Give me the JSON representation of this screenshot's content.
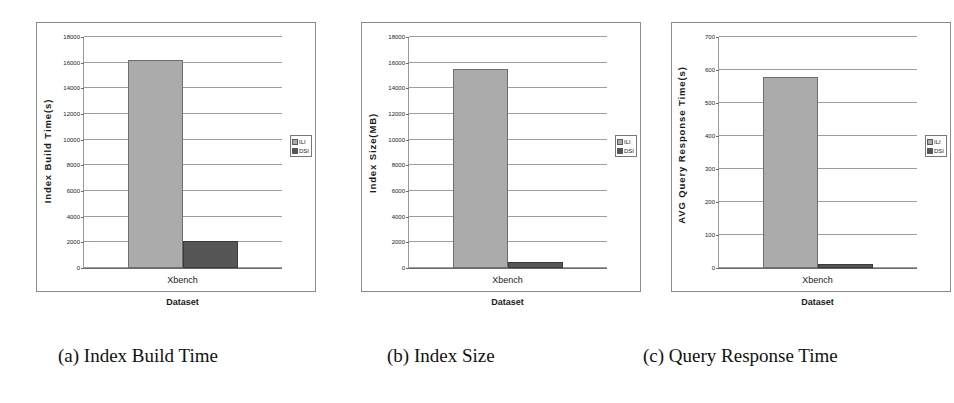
{
  "figure": {
    "background": "#ffffff",
    "series_colors": {
      "ILI": "#ababab",
      "DSI": "#565656"
    },
    "captions": [
      {
        "id": "a",
        "text": "(a) Index Build Time"
      },
      {
        "id": "b",
        "text": "(b) Index Size"
      },
      {
        "id": "c",
        "text": "(c) Query Response Time"
      }
    ]
  },
  "chart_data": [
    {
      "type": "bar",
      "title": "(a) Index Build Time",
      "xlabel": "Dataset",
      "ylabel": "Index  Build  Time(s)",
      "categories": [
        "Xbench"
      ],
      "series": [
        {
          "name": "ILI",
          "values": [
            16200
          ]
        },
        {
          "name": "DSI",
          "values": [
            2100
          ]
        }
      ],
      "ylim": [
        0,
        18000
      ],
      "yticks": [
        0,
        2000,
        4000,
        6000,
        8000,
        10000,
        12000,
        14000,
        16000,
        18000
      ],
      "ytick_labels": [
        "0",
        "2000",
        "4000",
        "6000",
        "8000",
        "10000",
        "12000",
        "14000",
        "16000",
        "18000"
      ],
      "grid": true,
      "legend": [
        "ILI",
        "DSI"
      ],
      "legend_position": "right"
    },
    {
      "type": "bar",
      "title": "(b) Index Size",
      "xlabel": "Dataset",
      "ylabel": "Index  Size(MB)",
      "categories": [
        "Xbench"
      ],
      "series": [
        {
          "name": "ILI",
          "values": [
            15500
          ]
        },
        {
          "name": "DSI",
          "values": [
            450
          ]
        }
      ],
      "ylim": [
        0,
        18000
      ],
      "yticks": [
        0,
        2000,
        4000,
        6000,
        8000,
        10000,
        12000,
        14000,
        16000,
        18000
      ],
      "ytick_labels": [
        "0",
        "2000",
        "4000",
        "6000",
        "8000",
        "10000",
        "12000",
        "14000",
        "16000",
        "18000"
      ],
      "grid": true,
      "legend": [
        "ILI",
        "DSI"
      ],
      "legend_position": "right"
    },
    {
      "type": "bar",
      "title": "(c) Query Response Time",
      "xlabel": "Dataset",
      "ylabel": "AVG Query Response Time(s)",
      "categories": [
        "Xbench"
      ],
      "series": [
        {
          "name": "ILI",
          "values": [
            580
          ]
        },
        {
          "name": "DSI",
          "values": [
            12
          ]
        }
      ],
      "ylim": [
        0,
        700
      ],
      "yticks": [
        0,
        100,
        200,
        300,
        400,
        500,
        600,
        700
      ],
      "ytick_labels": [
        "0",
        "100",
        "200",
        "300",
        "400",
        "500",
        "600",
        "700"
      ],
      "grid": true,
      "legend": [
        "ILI",
        "DSI"
      ],
      "legend_position": "right"
    }
  ]
}
